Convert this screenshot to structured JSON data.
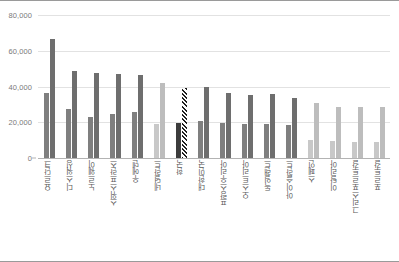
{
  "chart_data": {
    "type": "bar",
    "title": "",
    "subtitle": "",
    "xlabel": "",
    "ylabel": "",
    "ylim": [
      0,
      80000
    ],
    "yticks": [
      0,
      20000,
      40000,
      60000,
      80000
    ],
    "ytick_labels": [
      "0",
      "20,000",
      "40,000",
      "60,000",
      "80,000"
    ],
    "grid": true,
    "legend_position": "none",
    "categories": [
      "요르단크",
      "디스워싱",
      "노르웨이",
      "스위스프란스",
      "우에덴",
      "네덜란드",
      "한국",
      "대한민국",
      "프랑스우리아",
      "오스트리아",
      "독일랜드",
      "아이슬란드",
      "스페인",
      "이탈리아",
      "그리스포르투갈",
      "포르투갈"
    ],
    "series": [
      {
        "name": "시리즈 1",
        "values": [
          36500,
          27500,
          22800,
          24500,
          25800,
          19200,
          19400,
          20800,
          19600,
          19000,
          19100,
          18600,
          9800,
          9600,
          8900,
          9200
        ],
        "color": "#7f7f7f"
      },
      {
        "name": "시리즈 2",
        "values": [
          66800,
          48800,
          47600,
          47100,
          46700,
          41800,
          39000,
          39700,
          36400,
          35200,
          35900,
          33800,
          30800,
          28600,
          28400,
          28700
        ],
        "color": "#6e6e6e"
      }
    ],
    "highlight_index": 6,
    "highlight_pattern": "diagonal-hatch",
    "colors": {
      "dark_series_1": "#7f7f7f",
      "dark_series_2": "#6e6e6e",
      "light_series_1": "#c8c8c8",
      "light_series_2": "#bdbdbd",
      "highlight_series_1": "#3c3c3c",
      "highlight_series_2": "#2b2b2b",
      "gridline": "#e2e2e2",
      "axis": "#b3b3b3",
      "tick_text": "#7a7a7a",
      "label_text": "#595959",
      "frame_border": "#9a9a9a",
      "background": "#ffffff"
    }
  },
  "axis": {
    "y_tick_0": "0",
    "y_tick_1": "20,000",
    "y_tick_2": "40,000",
    "y_tick_3": "60,000",
    "y_tick_4": "80,000"
  }
}
